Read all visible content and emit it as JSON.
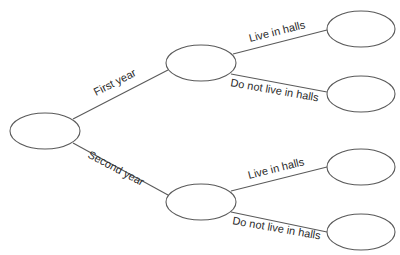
{
  "diagram": {
    "type": "tree",
    "root": {
      "id": "root",
      "label": ""
    },
    "branches": [
      {
        "label": "First year",
        "node": {
          "id": "first-year",
          "label": ""
        },
        "children": [
          {
            "label": "Live in halls",
            "node": {
              "id": "fy-halls",
              "label": ""
            }
          },
          {
            "label": "Do not live in halls",
            "node": {
              "id": "fy-not-halls",
              "label": ""
            }
          }
        ]
      },
      {
        "label": "Second year",
        "node": {
          "id": "second-year",
          "label": ""
        },
        "children": [
          {
            "label": "Live in halls",
            "node": {
              "id": "sy-halls",
              "label": ""
            }
          },
          {
            "label": "Do not live in halls",
            "node": {
              "id": "sy-not-halls",
              "label": ""
            }
          }
        ]
      }
    ],
    "colors": {
      "stroke": "#5a5a5a",
      "text": "#2a2a2a",
      "background": "#ffffff"
    }
  }
}
